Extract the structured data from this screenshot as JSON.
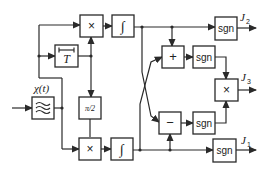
{
  "diagram": {
    "blocks": {
      "filter": {
        "symbol": "≋"
      },
      "delay": {
        "label": "T"
      },
      "mult_top": {
        "label": "×"
      },
      "int_top": {
        "label": "∫"
      },
      "phase": {
        "label": "π/2"
      },
      "mult_bottom": {
        "label": "×"
      },
      "int_bottom": {
        "label": "∫"
      },
      "sum": {
        "label": "+"
      },
      "diff": {
        "label": "−"
      },
      "sgn_sum": {
        "label": "sgn"
      },
      "sgn_diff": {
        "label": "sgn"
      },
      "mult_j3": {
        "label": "×"
      },
      "sgn_j2": {
        "label": "sgn"
      },
      "sgn_j1": {
        "label": "sgn"
      }
    },
    "signal_label": "χ(t)",
    "outputs": {
      "j2": {
        "main": "J",
        "sub": "2"
      },
      "j3": {
        "main": "J",
        "sub": "3"
      },
      "j1": {
        "main": "J",
        "sub": "1"
      }
    }
  }
}
